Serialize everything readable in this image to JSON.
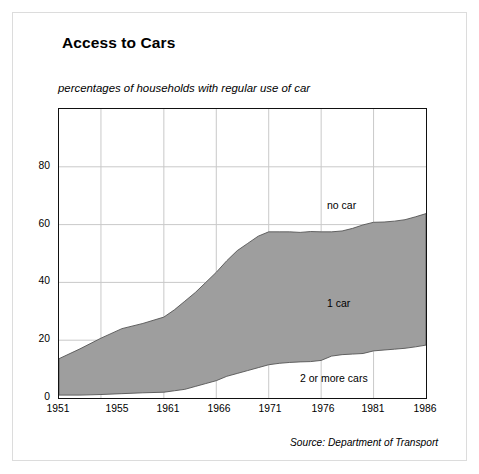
{
  "title": "Access to Cars",
  "subtitle": "percentages of households with regular use of car",
  "source": "Source: Department of Transport",
  "colors": {
    "band_fill": "#9e9e9e",
    "band_line": "#555555",
    "axis": "#111111",
    "grid": "#c9c9c9",
    "frame": "#dcdcdc",
    "background": "#ffffff"
  },
  "axes": {
    "y_ticks": [
      "0",
      "20",
      "40",
      "60",
      "80"
    ],
    "x_ticks": [
      "1951",
      "1955",
      "1961",
      "1966",
      "1971",
      "1976",
      "1981",
      "1986"
    ]
  },
  "series_labels": {
    "no_car": "no car",
    "one_car": "1 car",
    "two_or_more": "2 or more cars"
  },
  "chart_data": {
    "type": "area",
    "stacked": true,
    "title": "Access to Cars",
    "subtitle": "percentages of households with regular use of car",
    "xlabel": "",
    "ylabel": "",
    "ylim": [
      0,
      100
    ],
    "xlim": [
      1951,
      1986
    ],
    "grid": true,
    "legend_position": "inline-annotations",
    "note": "Stacked area. Bottom band = '2 or more cars' (white), middle band = '1 car' (grey), top band to 100 = 'no car' (white). Plotted boundaries are cumulative percentages.",
    "yticks": [
      0,
      20,
      40,
      60,
      80
    ],
    "xticks": [
      1951,
      1955,
      1961,
      1966,
      1971,
      1976,
      1981,
      1986
    ],
    "x": [
      1951,
      1953,
      1955,
      1957,
      1959,
      1961,
      1962,
      1963,
      1964,
      1965,
      1966,
      1967,
      1968,
      1969,
      1970,
      1971,
      1972,
      1973,
      1974,
      1975,
      1976,
      1977,
      1978,
      1979,
      1980,
      1981,
      1982,
      1983,
      1984,
      1985,
      1986
    ],
    "series": [
      {
        "name": "2 or more cars",
        "values": [
          1,
          1,
          1.2,
          1.5,
          1.8,
          2,
          2.5,
          3,
          4,
          5,
          6,
          7.5,
          8.5,
          9.5,
          10.5,
          11.5,
          12,
          12.3,
          12.5,
          12.6,
          13,
          14.5,
          15,
          15.2,
          15.4,
          16.3,
          16.6,
          16.9,
          17.2,
          17.7,
          18.3
        ]
      },
      {
        "name": "1 car",
        "values": [
          12.6,
          16,
          19.5,
          22.5,
          24,
          26,
          28,
          30.5,
          32.5,
          35,
          37.5,
          40,
          42.5,
          44,
          45.5,
          46,
          45.5,
          45.2,
          44.8,
          45,
          44.5,
          43,
          42.8,
          43.5,
          44.5,
          44.5,
          44.3,
          44.3,
          44.5,
          45,
          45.5
        ]
      },
      {
        "name": "no car",
        "values": [
          86.4,
          83,
          79.3,
          76,
          74.2,
          72,
          69.5,
          66.5,
          63.5,
          60,
          56.5,
          52.5,
          49,
          46.5,
          44,
          42.5,
          42.5,
          42.5,
          42.7,
          42.4,
          42.5,
          42.5,
          42.2,
          41.3,
          40.1,
          39.2,
          39.1,
          38.8,
          38.3,
          37.3,
          36.2
        ]
      }
    ],
    "cumulative_lower_boundary": [
      1,
      1,
      1.2,
      1.5,
      1.8,
      2,
      2.5,
      3,
      4,
      5,
      6,
      7.5,
      8.5,
      9.5,
      10.5,
      11.5,
      12,
      12.3,
      12.5,
      12.6,
      13,
      14.5,
      15,
      15.2,
      15.4,
      16.3,
      16.6,
      16.9,
      17.2,
      17.7,
      18.3
    ],
    "cumulative_upper_boundary": [
      13.6,
      17,
      20.7,
      24,
      25.8,
      28,
      30.5,
      33.5,
      36.5,
      40,
      43.5,
      47.5,
      51,
      53.5,
      56,
      57.5,
      57.5,
      57.5,
      57.3,
      57.6,
      57.5,
      57.5,
      57.8,
      58.7,
      59.9,
      60.8,
      60.9,
      61.2,
      61.7,
      62.7,
      63.8
    ]
  }
}
